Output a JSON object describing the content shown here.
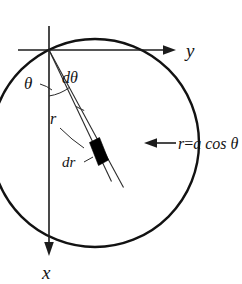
{
  "figure": {
    "kind": "polar-coordinate-diagram",
    "background_color": "#ffffff",
    "ink_color": "#141414",
    "axes": {
      "y_axis_label": "y",
      "x_axis_label": "x",
      "y_axis_direction": "right",
      "x_axis_direction": "down"
    },
    "labels": {
      "theta": "θ",
      "d_theta": "dθ",
      "r": "r",
      "d_r": "dr",
      "curve_equation_lhs": "r",
      "curve_equation_eq": "=",
      "curve_equation_rhs": "a cos θ",
      "curve_equation_full": "r = a cos θ"
    },
    "annotations": {
      "curve_callout_arrow": "arrow-pointing-left-at-circle",
      "element_shape": "filled-black-differential-area-element",
      "dr_leader": "short-leader-line-to-element",
      "r_leader": "short-leader-line-to-radial-ray"
    },
    "geometry": {
      "origin_x": 49,
      "origin_y": 50,
      "circle_center_x": 95,
      "circle_center_y": 143,
      "circle_radius": 104,
      "theta_degrees": 63,
      "dtheta_degrees": 7
    }
  }
}
